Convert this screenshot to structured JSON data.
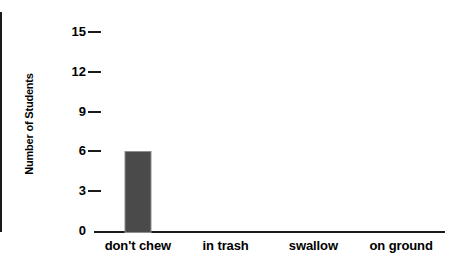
{
  "chart_data": {
    "type": "bar",
    "title": "",
    "xlabel": "",
    "ylabel": "Number of Students",
    "categories": [
      "don't chew",
      "in trash",
      "swallow",
      "on ground"
    ],
    "values": [
      6,
      0,
      0,
      0
    ],
    "ylim": [
      0,
      16.5
    ],
    "yticks": [
      0,
      3,
      6,
      9,
      12,
      15
    ],
    "ytick_labels": [
      "0",
      "3",
      "6",
      "9",
      "12",
      "15"
    ],
    "grid": false,
    "legend": false,
    "bar_color": "#4a4a4a",
    "axis_color": "#1a1a1a",
    "background": "#ffffff"
  }
}
